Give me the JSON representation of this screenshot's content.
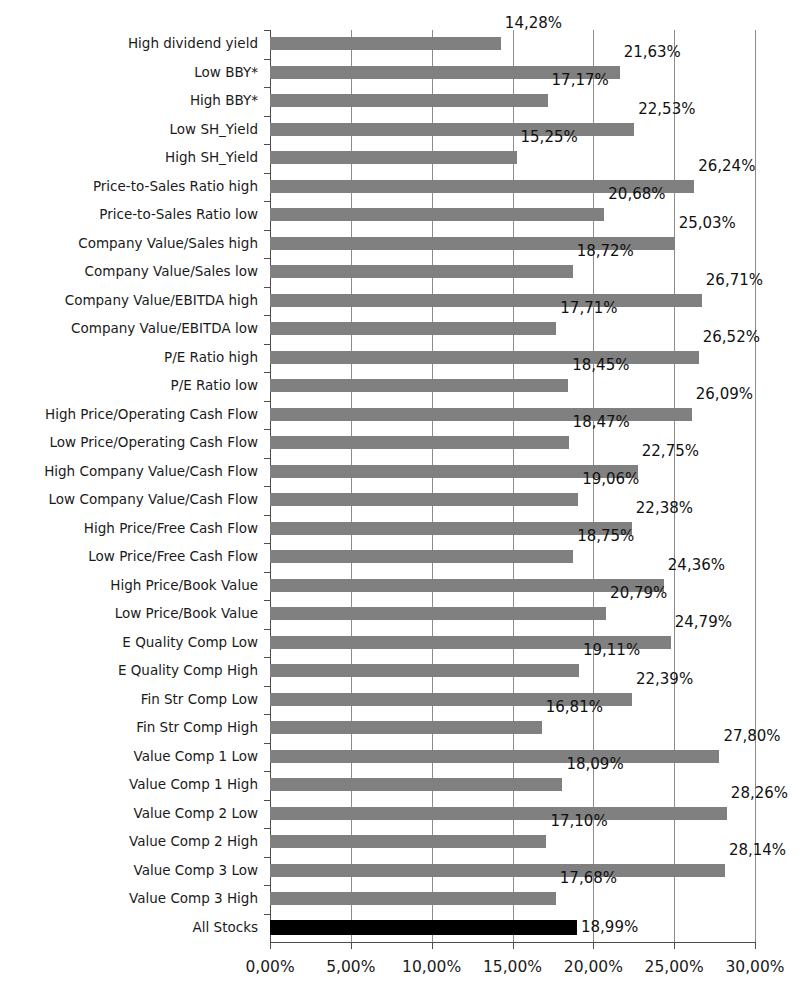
{
  "chart_data": {
    "type": "bar",
    "orientation": "horizontal",
    "title": "",
    "subtitle": "",
    "xlabel": "",
    "ylabel": "",
    "xlim": [
      0,
      30
    ],
    "xtick_values": [
      0,
      5,
      10,
      15,
      20,
      25,
      30
    ],
    "xtick_labels": [
      "0,00%",
      "5,00%",
      "10,00%",
      "15,00%",
      "20,00%",
      "25,00%",
      "30,00%"
    ],
    "grid": true,
    "grid_axis": "x",
    "legend": false,
    "decimal_separator": ",",
    "value_suffix": "%",
    "bar_color": "#808080",
    "highlight_color": "#000000",
    "gridline_color": "#8c8c8c",
    "axis_color": "#4d4d4d",
    "categories": [
      "High dividend yield",
      "Low BBY*",
      "High BBY*",
      "Low SH_Yield",
      "High SH_Yield",
      "Price-to-Sales Ratio high",
      "Price-to-Sales Ratio low",
      "Company Value/Sales high",
      "Company Value/Sales low",
      "Company Value/EBITDA high",
      "Company Value/EBITDA low",
      "P/E Ratio high",
      "P/E Ratio low",
      "High Price/Operating Cash Flow",
      "Low Price/Operating Cash Flow",
      "High Company Value/Cash Flow",
      "Low Company Value/Cash Flow",
      "High Price/Free Cash Flow",
      "Low Price/Free Cash Flow",
      "High Price/Book Value",
      "Low Price/Book Value",
      "E Quality Comp Low",
      "E Quality Comp High",
      "Fin Str Comp Low",
      "Fin Str Comp High",
      "Value Comp 1 Low",
      "Value Comp 1 High",
      "Value Comp 2 Low",
      "Value Comp 2 High",
      "Value Comp 3 Low",
      "Value Comp 3 High",
      "All Stocks"
    ],
    "values": [
      14.28,
      21.63,
      17.17,
      22.53,
      15.25,
      26.24,
      20.68,
      25.03,
      18.72,
      26.71,
      17.71,
      26.52,
      18.45,
      26.09,
      18.47,
      22.75,
      19.06,
      22.38,
      18.75,
      24.36,
      20.79,
      24.79,
      19.11,
      22.39,
      16.81,
      27.8,
      18.09,
      28.26,
      17.1,
      28.14,
      17.68,
      18.99
    ],
    "value_labels": [
      "14,28%",
      "21,63%",
      "17,17%",
      "22,53%",
      "15,25%",
      "26,24%",
      "20,68%",
      "25,03%",
      "18,72%",
      "26,71%",
      "17,71%",
      "26,52%",
      "18,45%",
      "26,09%",
      "18,47%",
      "22,75%",
      "19,06%",
      "22,38%",
      "18,75%",
      "24,36%",
      "20,79%",
      "24,79%",
      "19,11%",
      "22,39%",
      "16,81%",
      "27,80%",
      "18,09%",
      "28,26%",
      "17,10%",
      "28,14%",
      "17,68%",
      "18,99%"
    ],
    "highlight_indices": [
      31
    ],
    "footnote": ""
  }
}
